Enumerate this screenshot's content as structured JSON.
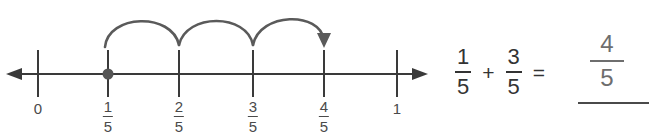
{
  "figure": {
    "kind": "number-line-fraction-addition",
    "background_color": "#ffffff",
    "line_color": "#3a3a3a",
    "arc_color": "#5a5a5a",
    "label_color": "#4a4a4a",
    "equation_color": "#333333",
    "answer_color": "#6e6e6e"
  },
  "numberline": {
    "start_label": "0",
    "end_label": "1",
    "ticks": [
      {
        "name": "tick-0",
        "type": "whole",
        "text": "0",
        "x": 38
      },
      {
        "name": "tick-1-5",
        "type": "fraction",
        "numerator": "1",
        "denominator": "5",
        "x": 108
      },
      {
        "name": "tick-2-5",
        "type": "fraction",
        "numerator": "2",
        "denominator": "5",
        "x": 179
      },
      {
        "name": "tick-3-5",
        "type": "fraction",
        "numerator": "3",
        "denominator": "5",
        "x": 253
      },
      {
        "name": "tick-4-5",
        "type": "fraction",
        "numerator": "4",
        "denominator": "5",
        "x": 324
      },
      {
        "name": "tick-1",
        "type": "whole",
        "text": "1",
        "x": 397
      }
    ],
    "point_marker": {
      "label": "1/5",
      "x": 108
    },
    "hops": [
      {
        "from": "1/5",
        "to": "2/5"
      },
      {
        "from": "2/5",
        "to": "3/5"
      },
      {
        "from": "3/5",
        "to": "4/5",
        "arrowhead": true
      }
    ]
  },
  "equation": {
    "first": {
      "numerator": "1",
      "denominator": "5"
    },
    "plus": "+",
    "second": {
      "numerator": "3",
      "denominator": "5"
    },
    "equals": "=",
    "answer": {
      "numerator": "4",
      "denominator": "5"
    }
  },
  "labels": {
    "zero": "0",
    "one": "1",
    "one_fifth_num": "1",
    "one_fifth_den": "5",
    "two_fifth_num": "2",
    "two_fifth_den": "5",
    "three_fifth_num": "3",
    "three_fifth_den": "5",
    "four_fifth_num": "4",
    "four_fifth_den": "5"
  }
}
